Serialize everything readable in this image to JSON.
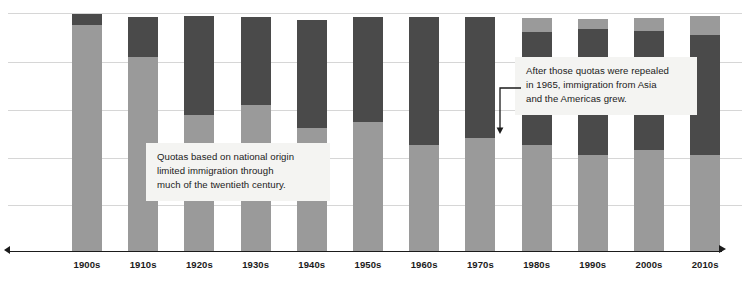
{
  "chart_data": {
    "type": "bar",
    "subtype": "stacked-bar",
    "title": "",
    "xlabel": "",
    "ylabel": "",
    "grid": true,
    "legend_position": "none",
    "axis": {
      "x_tick_labels": [
        "1900s",
        "1910s",
        "1920s",
        "1930s",
        "1940s",
        "1950s",
        "1960s",
        "1970s",
        "1980s",
        "1990s",
        "2000s",
        "2010s"
      ],
      "y_gridline_count": 5,
      "y_axis_visible": false
    },
    "categories": [
      "1900s",
      "1910s",
      "1920s",
      "1930s",
      "1940s",
      "1950s",
      "1960s",
      "1970s",
      "1980s",
      "1990s",
      "2000s",
      "2010s"
    ],
    "series": [
      {
        "name": "Europe",
        "color": "#9a9a9a",
        "values": [
          92,
          81,
          57,
          41,
          46,
          53,
          43,
          29,
          20,
          17,
          15,
          13
        ]
      },
      {
        "name": "Other regions",
        "color": "#4a4a4a",
        "values": [
          6,
          17,
          42,
          56,
          51,
          44,
          55,
          69,
          78,
          81,
          83,
          85
        ]
      }
    ],
    "bar_segments": [
      {
        "category": "1900s",
        "segments": [
          {
            "series": "Other regions",
            "top_px": 14,
            "bottom_px": 25
          },
          {
            "series": "Europe",
            "top_px": 25,
            "bottom_px": 251
          }
        ]
      },
      {
        "category": "1910s",
        "segments": [
          {
            "series": "Other regions",
            "top_px": 17,
            "bottom_px": 57
          },
          {
            "series": "Europe",
            "top_px": 57,
            "bottom_px": 251
          }
        ]
      },
      {
        "category": "1920s",
        "segments": [
          {
            "series": "Other regions",
            "top_px": 16,
            "bottom_px": 115
          },
          {
            "series": "Europe",
            "top_px": 115,
            "bottom_px": 251
          }
        ]
      },
      {
        "category": "1930s",
        "segments": [
          {
            "series": "Other regions",
            "top_px": 17,
            "bottom_px": 105
          },
          {
            "series": "Europe",
            "top_px": 105,
            "bottom_px": 251
          }
        ]
      },
      {
        "category": "1940s",
        "segments": [
          {
            "series": "Other regions",
            "top_px": 20,
            "bottom_px": 128
          },
          {
            "series": "Europe",
            "top_px": 128,
            "bottom_px": 251
          }
        ]
      },
      {
        "category": "1950s",
        "segments": [
          {
            "series": "Other regions",
            "top_px": 17,
            "bottom_px": 122
          },
          {
            "series": "Europe",
            "top_px": 122,
            "bottom_px": 251
          }
        ]
      },
      {
        "category": "1960s",
        "segments": [
          {
            "series": "Other regions",
            "top_px": 17,
            "bottom_px": 145
          },
          {
            "series": "Europe",
            "top_px": 145,
            "bottom_px": 251
          }
        ]
      },
      {
        "category": "1970s",
        "segments": [
          {
            "series": "Other regions",
            "top_px": 17,
            "bottom_px": 138
          },
          {
            "series": "Europe",
            "top_px": 138,
            "bottom_px": 251
          }
        ]
      },
      {
        "category": "1980s",
        "segments": [
          {
            "series": "Europe",
            "top_px": 18,
            "bottom_px": 32
          },
          {
            "series": "Other regions",
            "top_px": 32,
            "bottom_px": 145
          },
          {
            "series": "Europe",
            "top_px": 145,
            "bottom_px": 251
          }
        ]
      },
      {
        "category": "1990s",
        "segments": [
          {
            "series": "Europe",
            "top_px": 19,
            "bottom_px": 29
          },
          {
            "series": "Other regions",
            "top_px": 29,
            "bottom_px": 155
          },
          {
            "series": "Europe",
            "top_px": 155,
            "bottom_px": 251
          }
        ]
      },
      {
        "category": "2000s",
        "segments": [
          {
            "series": "Europe",
            "top_px": 18,
            "bottom_px": 31
          },
          {
            "series": "Other regions",
            "top_px": 31,
            "bottom_px": 150
          },
          {
            "series": "Europe",
            "top_px": 150,
            "bottom_px": 251
          }
        ]
      },
      {
        "category": "2010s",
        "segments": [
          {
            "series": "Europe",
            "top_px": 16,
            "bottom_px": 35
          },
          {
            "series": "Other regions",
            "top_px": 35,
            "bottom_px": 155
          },
          {
            "series": "Europe",
            "top_px": 155,
            "bottom_px": 251
          }
        ]
      }
    ],
    "annotations": [
      {
        "id": "quotas",
        "text": "Quotas based on national origin\nlimited immigration through\nmuch of the twentieth century.",
        "has_leader": false
      },
      {
        "id": "repealed",
        "text": "After those quotas were repealed\nin 1965, immigration from Asia\nand the Americas grew.",
        "has_leader": true,
        "leader_target": "1970s bar"
      }
    ]
  },
  "colors": {
    "europe": "#9a9a9a",
    "other": "#4a4a4a",
    "gridline": "#d6d6d6",
    "axis": "#1b1b1b",
    "annotation_bg": "#f4f4f2",
    "text": "#1b1b1b",
    "background": "#ffffff"
  }
}
